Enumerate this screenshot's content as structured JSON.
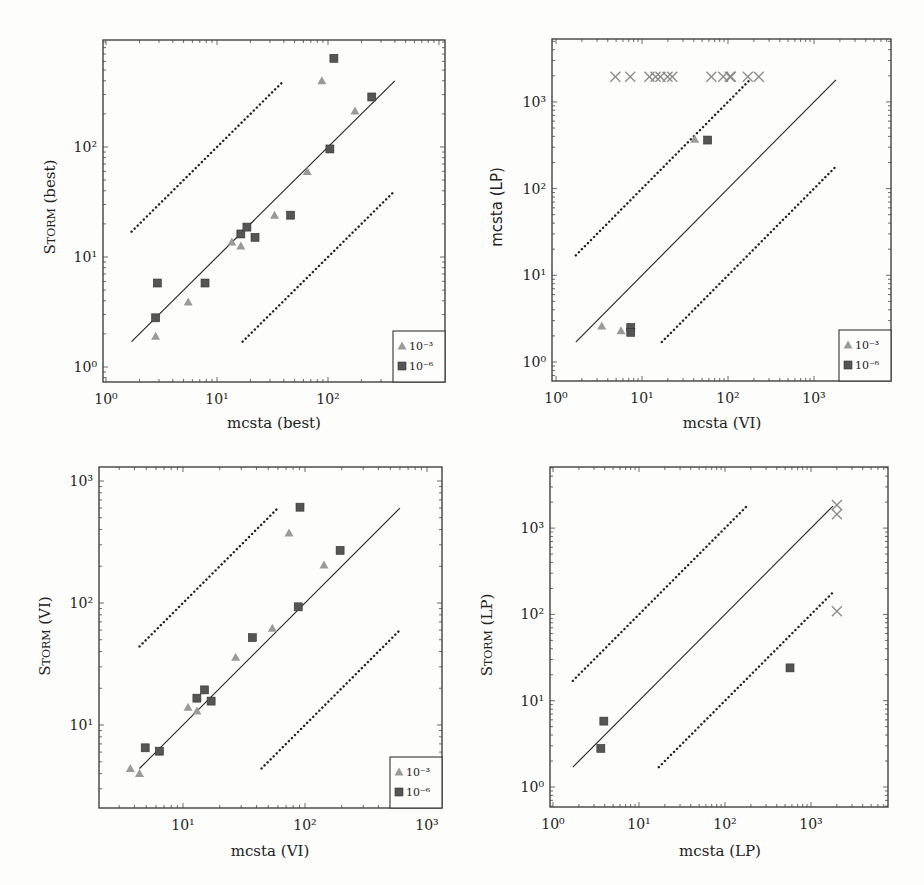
{
  "chart_data": [
    {
      "id": "tl",
      "type": "scatter",
      "title": "",
      "xlabel": "mcsta (best)",
      "ylabel": "Storm (best)",
      "xscale": "log",
      "yscale": "log",
      "xlim": [
        0.93,
        1100
      ],
      "ylim": [
        0.78,
        850
      ],
      "xticks": [
        "10^0",
        "10^1",
        "10^2"
      ],
      "yticks": [
        "10^0",
        "10^1",
        "10^2"
      ],
      "grid": false,
      "legend_position": "lower right",
      "reference_lines": [
        {
          "style": "solid",
          "factor": 1,
          "x_range": [
            1.7,
            400
          ]
        },
        {
          "style": "dotted",
          "factor": 10,
          "x_range": [
            1.7,
            40
          ]
        },
        {
          "style": "dotted",
          "factor": 0.1,
          "x_range": [
            17,
            400
          ]
        }
      ],
      "series": [
        {
          "name": "10^-3",
          "marker": "triangle",
          "color": "#9a9a9a",
          "x": [
            2.8,
            5.5,
            13.6,
            16.4,
            33,
            65,
            88,
            175
          ],
          "y": [
            1.9,
            3.9,
            13.7,
            12.6,
            24,
            60,
            400,
            212
          ]
        },
        {
          "name": "10^-6",
          "marker": "square",
          "color": "#555555",
          "x": [
            2.9,
            2.8,
            7.8,
            16.4,
            18.6,
            22,
            46,
            104,
            113,
            248
          ],
          "y": [
            5.8,
            2.8,
            5.8,
            16.2,
            18.7,
            15.1,
            24,
            96,
            640,
            285
          ]
        }
      ]
    },
    {
      "id": "tr",
      "type": "scatter",
      "title": "",
      "xlabel": "mcsta (VI)",
      "ylabel": "mcsta (LP)",
      "xscale": "log",
      "yscale": "log",
      "xlim": [
        0.9,
        5000
      ],
      "ylim": [
        0.72,
        4000
      ],
      "xticks": [
        "10^0",
        "10^1",
        "10^2",
        "10^3"
      ],
      "yticks": [
        "10^0",
        "10^1",
        "10^2",
        "10^3"
      ],
      "grid": false,
      "legend_position": "lower right",
      "reference_lines": [
        {
          "style": "solid",
          "factor": 1,
          "x_range": [
            1.7,
            1800
          ]
        },
        {
          "style": "dotted",
          "factor": 10,
          "x_range": [
            1.7,
            180
          ]
        },
        {
          "style": "dotted",
          "factor": 0.1,
          "x_range": [
            17,
            1800
          ]
        }
      ],
      "series": [
        {
          "name": "10^-3",
          "marker": "triangle",
          "color": "#9a9a9a",
          "x": [
            3.4,
            5.7,
            41
          ],
          "y": [
            2.6,
            2.3,
            372
          ]
        },
        {
          "name": "10^-6",
          "marker": "square",
          "color": "#555555",
          "x": [
            7.4,
            7.4,
            58
          ],
          "y": [
            2.5,
            2.2,
            363
          ]
        },
        {
          "name": "timeout",
          "marker": "x",
          "color": "#8a8a8a",
          "legend": false,
          "x": [
            4.9,
            7.3,
            12.2,
            14.4,
            16.4,
            19.8,
            22.5,
            64,
            88,
            105,
            108,
            170,
            228
          ],
          "y": [
            1950,
            1950,
            1950,
            1950,
            1950,
            1950,
            1950,
            1950,
            1950,
            1950,
            1950,
            1950,
            1950
          ]
        }
      ]
    },
    {
      "id": "bl",
      "type": "scatter",
      "title": "",
      "xlabel": "mcsta (VI)",
      "ylabel": "Storm (VI)",
      "xscale": "log",
      "yscale": "log",
      "xlim": [
        2.05,
        1100
      ],
      "ylim": [
        2.1,
        1300
      ],
      "xticks": [
        "10^1",
        "10^2",
        "10^3"
      ],
      "yticks": [
        "10^1",
        "10^2",
        "10^3"
      ],
      "grid": false,
      "legend_position": "lower right",
      "reference_lines": [
        {
          "style": "solid",
          "factor": 1,
          "x_range": [
            4.4,
            600
          ]
        },
        {
          "style": "dotted",
          "factor": 10,
          "x_range": [
            4.4,
            60
          ]
        },
        {
          "style": "dotted",
          "factor": 0.1,
          "x_range": [
            44,
            600
          ]
        }
      ],
      "series": [
        {
          "name": "10^-3",
          "marker": "triangle",
          "color": "#9a9a9a",
          "x": [
            3.7,
            4.4,
            11,
            13,
            27,
            54,
            74,
            143
          ],
          "y": [
            4.4,
            4.0,
            14,
            13,
            36,
            62,
            374,
            205
          ]
        },
        {
          "name": "10^-6",
          "marker": "square",
          "color": "#555555",
          "x": [
            4.9,
            6.4,
            13,
            15,
            17,
            37,
            88,
            91,
            194
          ],
          "y": [
            6.5,
            6.1,
            16.6,
            19.4,
            15.7,
            52,
            93,
            610,
            270
          ]
        }
      ]
    },
    {
      "id": "br",
      "type": "scatter",
      "title": "",
      "xlabel": "mcsta (LP)",
      "ylabel": "Storm (LP)",
      "xscale": "log",
      "yscale": "log",
      "xlim": [
        0.92,
        4600
      ],
      "ylim": [
        0.72,
        4000
      ],
      "xticks": [
        "10^0",
        "10^1",
        "10^2",
        "10^3"
      ],
      "yticks": [
        "10^0",
        "10^1",
        "10^2",
        "10^3"
      ],
      "grid": false,
      "legend": false,
      "reference_lines": [
        {
          "style": "solid",
          "factor": 1,
          "x_range": [
            1.7,
            1800
          ]
        },
        {
          "style": "dotted",
          "factor": 10,
          "x_range": [
            1.7,
            180
          ]
        },
        {
          "style": "dotted",
          "factor": 0.1,
          "x_range": [
            17,
            1800
          ]
        }
      ],
      "series": [
        {
          "name": "10^-6",
          "marker": "square",
          "color": "#555555",
          "x": [
            3.6,
            3.9,
            570
          ],
          "y": [
            2.8,
            5.8,
            24
          ]
        },
        {
          "name": "timeout",
          "marker": "x",
          "color": "#8a8a8a",
          "legend": false,
          "x": [
            2000,
            2000,
            2000
          ],
          "y": [
            1850,
            1450,
            109
          ]
        }
      ]
    }
  ],
  "panels": {
    "tl": {
      "ylabel_main": "Storm",
      "ylabel_suffix": " (best)",
      "xlabel": "mcsta (best)"
    },
    "tr": {
      "ylabel_main": "mcsta",
      "ylabel_suffix": " (LP)",
      "xlabel": "mcsta (VI)"
    },
    "bl": {
      "ylabel_main": "Storm",
      "ylabel_suffix": " (VI)",
      "xlabel": "mcsta (VI)"
    },
    "br": {
      "ylabel_main": "Storm",
      "ylabel_suffix": " (LP)",
      "xlabel": "mcsta (LP)"
    }
  },
  "legend": {
    "entries": [
      "10^-3",
      "10^-6"
    ]
  }
}
